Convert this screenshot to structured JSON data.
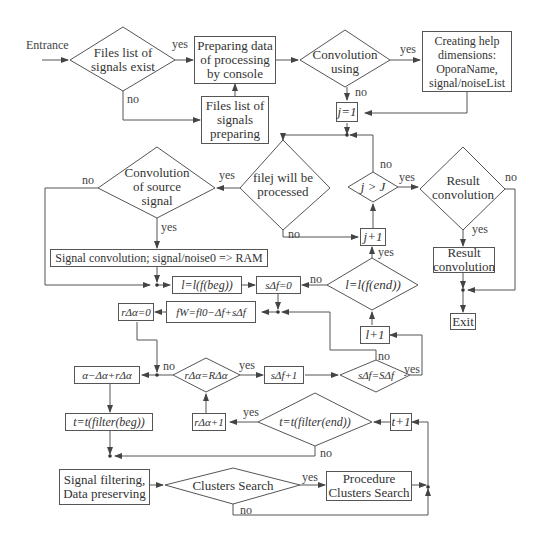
{
  "labels": {
    "entrance": "Entrance",
    "yes": "yes",
    "no": "no"
  },
  "nodes": {
    "files_exist": "Files list of signals exist",
    "prep_console": "Preparing data of processing by console",
    "files_prep": "Files list of signals preparing",
    "conv_using": "Convolution using",
    "help_dims": "Creating help dimensions: OporaName, signal/noiseList",
    "j_init": "j=1",
    "file_processed": "filej will be processed",
    "j_gt_J": "j > J",
    "result_conv_q": "Result convolution",
    "conv_source": "Convolution of source signal",
    "j_inc": "j+1",
    "result_conv_box": "Result convolution",
    "signal_conv": "Signal convolution; signal/noise0 => RAM",
    "l_beg": "l=l(f(beg))",
    "s_zero": "sΔf=0",
    "l_end": "l=l(f(end))",
    "exit": "Exit",
    "r_zero": "rΔα=0",
    "fw": "fW=fl0−Δf+sΔf",
    "l_inc": "l+1",
    "alpha": "α−Δα+rΔα",
    "r_eq_R": "rΔα=RΔα",
    "s_inc": "sΔf+1",
    "s_eq_S": "sΔf=SΔf",
    "t_beg": "t=t(filter(beg))",
    "r_inc": "rΔα+1",
    "t_end": "t=t(filter(end))",
    "t_inc": "t+1",
    "filtering": "Signal filtering, Data preserving",
    "clusters_q": "Clusters Search",
    "clusters_proc": "Procedure Clusters Search"
  }
}
